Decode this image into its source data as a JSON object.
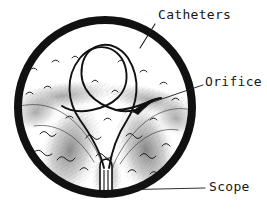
{
  "figure": {
    "type": "medical-illustration",
    "background_color": "#ffffff",
    "ink_color": "#161616",
    "shading_color": "#8a8a8a",
    "view": {
      "name": "endoscopic-circular-view",
      "shape": "circle",
      "center_x": 105,
      "center_y": 107,
      "radius": 91,
      "border_width": 8,
      "border_color": "#111111",
      "field_color": "#ffffff"
    },
    "callouts": [
      {
        "id": "catheters",
        "label": "Catheters",
        "label_x": 158,
        "label_y": 8,
        "leader_from_x": 155,
        "leader_from_y": 24,
        "leader_to_x": 140,
        "leader_to_y": 48
      },
      {
        "id": "orifice",
        "label": "Orifice",
        "label_x": 205,
        "label_y": 75,
        "leader_from_x": 203,
        "leader_from_y": 85,
        "leader_to_x": 150,
        "leader_to_y": 103
      },
      {
        "id": "scope",
        "label": "Scope",
        "label_x": 209,
        "label_y": 180,
        "leader_from_x": 205,
        "leader_from_y": 188,
        "leader_to_x": 113,
        "leader_to_y": 190
      }
    ],
    "anatomy": {
      "orifice": {
        "name": "orifice",
        "x": 148,
        "y": 104,
        "description": "dark slit where catheter tip enters tissue"
      },
      "scope": {
        "name": "scope",
        "x": 106,
        "y": 183,
        "description": "narrow instrument tube entering from bottom of field"
      },
      "fold_shading": "stippled gray tissue folds forming a V shape converging at the scope"
    },
    "catheters": {
      "count": 2,
      "description": "two thin looped catheter tubes rising from the scope and curving toward the orifice"
    }
  }
}
